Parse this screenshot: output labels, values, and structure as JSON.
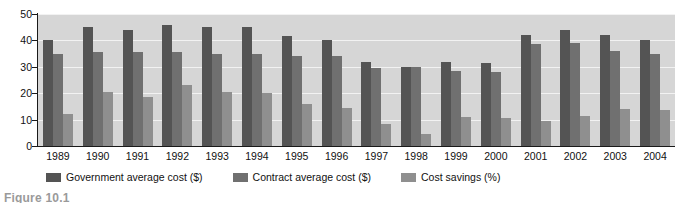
{
  "caption": "Figure 10.1",
  "legend": {
    "position": "bottom",
    "items": [
      {
        "label": "Government average cost ($)",
        "color": "#545454",
        "key": "gov"
      },
      {
        "label": "Contract average cost ($)",
        "color": "#707070",
        "key": "contract"
      },
      {
        "label": "Cost savings (%)",
        "color": "#8f8f8f",
        "key": "savings"
      }
    ]
  },
  "axes": {
    "y_ticks": [
      "50",
      "40",
      "30",
      "20",
      "10",
      "0"
    ],
    "x_label": "",
    "y_label": ""
  },
  "chart_data": {
    "type": "bar",
    "title": "",
    "subtitle": "",
    "xlabel": "",
    "ylabel": "",
    "ylim": [
      0,
      50
    ],
    "yticks": [
      0,
      10,
      20,
      30,
      40,
      50
    ],
    "grid": true,
    "legend_position": "bottom",
    "categories": [
      "1989",
      "1990",
      "1991",
      "1992",
      "1993",
      "1994",
      "1995",
      "1996",
      "1997",
      "1998",
      "1999",
      "2000",
      "2001",
      "2002",
      "2003",
      "2004"
    ],
    "series": [
      {
        "name": "Government average cost ($)",
        "color": "#545454",
        "values": [
          40,
          45,
          44,
          46,
          45,
          45,
          41.5,
          40,
          32,
          30,
          32,
          31.5,
          42,
          44,
          42,
          40
        ]
      },
      {
        "name": "Contract average cost ($)",
        "color": "#707070",
        "values": [
          35,
          35.5,
          35.5,
          35.5,
          35,
          35,
          34,
          34,
          29.5,
          30,
          28.5,
          28,
          38.5,
          39,
          36,
          35
        ]
      },
      {
        "name": "Cost savings (%)",
        "color": "#8f8f8f",
        "values": [
          12,
          20.5,
          18.5,
          23,
          20.5,
          20,
          16,
          14.5,
          8.5,
          4.5,
          11,
          10.5,
          9.5,
          11.5,
          14,
          13.5
        ]
      }
    ]
  }
}
